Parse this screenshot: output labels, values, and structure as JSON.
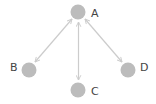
{
  "diagram": {
    "type": "graph",
    "colors": {
      "node_fill": "#bcbcbc",
      "edge": "#cccccc",
      "label": "#444444",
      "background": "#ffffff"
    },
    "nodes": [
      {
        "id": "A",
        "label": "A",
        "x": 78,
        "y": 12
      },
      {
        "id": "B",
        "label": "B",
        "x": 29,
        "y": 70
      },
      {
        "id": "C",
        "label": "C",
        "x": 78,
        "y": 90
      },
      {
        "id": "D",
        "label": "D",
        "x": 128,
        "y": 70
      }
    ],
    "edges": [
      {
        "from": "A",
        "to": "B",
        "direction": "bidirectional"
      },
      {
        "from": "A",
        "to": "C",
        "direction": "bidirectional"
      },
      {
        "from": "A",
        "to": "D",
        "direction": "bidirectional"
      }
    ]
  }
}
